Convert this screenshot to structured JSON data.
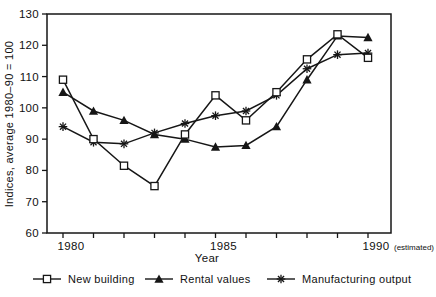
{
  "chart_data": {
    "type": "line",
    "title": "",
    "xlabel": "Year",
    "ylabel": "Indices, average 1980–90 = 100",
    "x": [
      1980,
      1981,
      1982,
      1983,
      1984,
      1985,
      1986,
      1987,
      1988,
      1989,
      1990
    ],
    "series": [
      {
        "name": "New building",
        "marker": "open-square",
        "values": [
          109,
          90,
          81.5,
          75,
          91.5,
          104,
          96,
          105,
          115.5,
          123.5,
          116
        ]
      },
      {
        "name": "Rental values",
        "marker": "filled-triangle",
        "values": [
          105,
          99,
          96,
          91.5,
          90,
          87.5,
          88,
          94,
          109,
          123,
          122.5
        ]
      },
      {
        "name": "Manufacturing output",
        "marker": "asterisk",
        "values": [
          94,
          89,
          88.5,
          92,
          95,
          97.5,
          99,
          104,
          112.5,
          117,
          117.5
        ]
      }
    ],
    "ylim": [
      60,
      130
    ],
    "ytick_step": 10,
    "yticks": [
      60,
      70,
      80,
      90,
      100,
      110,
      120,
      130
    ],
    "xticks": [
      {
        "year": 1980,
        "label": "1980"
      },
      {
        "year": 1985,
        "label": "1985"
      },
      {
        "year": 1990,
        "label": "1990",
        "suffix": "(estimated)"
      }
    ],
    "grid": false,
    "legend_position": "bottom",
    "line_color": "#161616",
    "background": "#ffffff"
  }
}
